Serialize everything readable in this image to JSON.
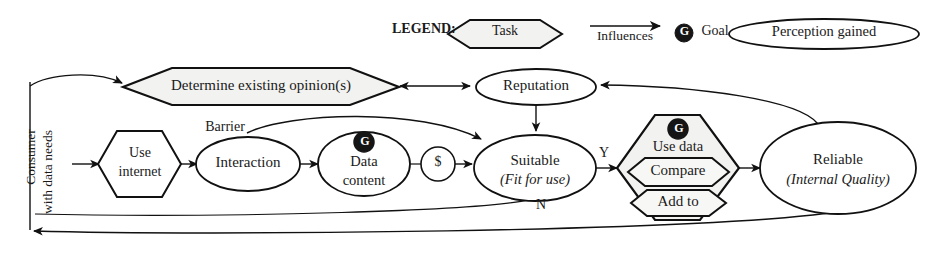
{
  "diagram": {
    "legend": {
      "label": "LEGEND:",
      "items": [
        {
          "name": "task-legend",
          "shape": "hexagon",
          "text": "Task"
        },
        {
          "name": "influences-legend",
          "shape": "arrow",
          "text": "Influences"
        },
        {
          "name": "goal-legend",
          "shape": "goal-badge",
          "badge": "G",
          "text": "Goal"
        },
        {
          "name": "perception-legend",
          "shape": "ellipse",
          "text": "Perception gained"
        }
      ]
    },
    "entry_label": {
      "line1": "Consumer",
      "line2": "with data needs"
    },
    "nodes": {
      "determine_opinions": {
        "label": "Determine existing opinion(s)",
        "shape": "hexagon"
      },
      "reputation": {
        "label": "Reputation",
        "shape": "ellipse"
      },
      "use_internet": {
        "label_line1": "Use",
        "label_line2": "internet",
        "shape": "hexagon"
      },
      "interaction": {
        "label": "Interaction",
        "shape": "ellipse"
      },
      "data_content": {
        "label_line1": "Data",
        "label_line2": "content",
        "shape": "ellipse",
        "badge": "G"
      },
      "money": {
        "label": "$",
        "shape": "circle"
      },
      "suitable": {
        "label_line1": "Suitable",
        "label_line2": "(Fit for use)",
        "shape": "ellipse"
      },
      "use_data": {
        "label": "Use data",
        "shape": "hexagon",
        "badge": "G",
        "sub": [
          {
            "label": "Compare",
            "shape": "hexagon"
          },
          {
            "label": "Add to",
            "shape": "hexagon"
          }
        ]
      },
      "reliable": {
        "label_line1": "Reliable",
        "label_line2": "(Internal Quality)",
        "shape": "ellipse"
      }
    },
    "edge_labels": {
      "barrier": "Barrier",
      "yes": "Y",
      "no": "N"
    },
    "colors": {
      "stroke": "#111111",
      "task_fill": "#f2f2f0",
      "background": "#ffffff",
      "badge_fill": "#151515",
      "badge_text": "#ffffff"
    }
  }
}
